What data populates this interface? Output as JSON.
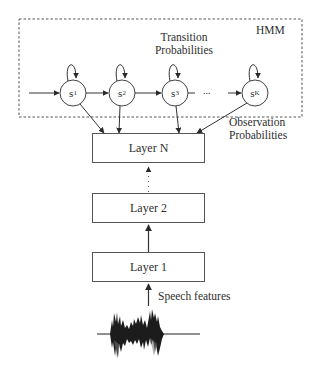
{
  "diagram": {
    "type": "DNN-HMM hybrid speech recognition architecture",
    "hmm": {
      "title": "HMM",
      "transition_label_line1": "Transition",
      "transition_label_line2": "Probabilities",
      "states": [
        {
          "base": "s",
          "sub": "1"
        },
        {
          "base": "s",
          "sub": "2"
        },
        {
          "base": "s",
          "sub": "3"
        },
        {
          "base": "s",
          "sub": "K"
        }
      ],
      "ellipsis": "..."
    },
    "observation_label_line1": "Observation",
    "observation_label_line2": "Probabilities",
    "layers": [
      {
        "label": "Layer N"
      },
      {
        "label": "Layer 2"
      },
      {
        "label": "Layer 1"
      }
    ],
    "input_label": "Speech features",
    "input_icon": "speech-waveform",
    "colors": {
      "line": "#3a3a3a",
      "dashed_border": "#555555",
      "text": "#2e2e2e",
      "background": "#ffffff"
    }
  }
}
